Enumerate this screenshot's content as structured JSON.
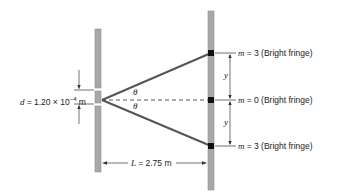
{
  "diagram": {
    "type": "double-slit interference geometry",
    "slit_separation": {
      "symbol": "d",
      "equals": "=",
      "value": "1.20 × 10",
      "exponent": "−4",
      "unit": "m"
    },
    "distance_to_screen": {
      "symbol": "L",
      "equals": "=",
      "value": "2.75 m"
    },
    "angle_symbol": "θ",
    "fringe_spacing_symbol": "y",
    "fringes": [
      {
        "symbol": "m",
        "equals": "= 3",
        "label": "(Bright fringe)",
        "position": "top"
      },
      {
        "symbol": "m",
        "equals": "= 0",
        "label": "(Bright fringe)",
        "position": "center"
      },
      {
        "symbol": "m",
        "equals": "= 3",
        "label": "(Bright fringe)",
        "position": "bottom"
      }
    ],
    "colors": {
      "barrier": "#a8a8a8",
      "barrier_edge": "#8c8c8c",
      "ray": "#555555",
      "fringe_marker": "#111111",
      "dimension_line": "#333333"
    }
  }
}
